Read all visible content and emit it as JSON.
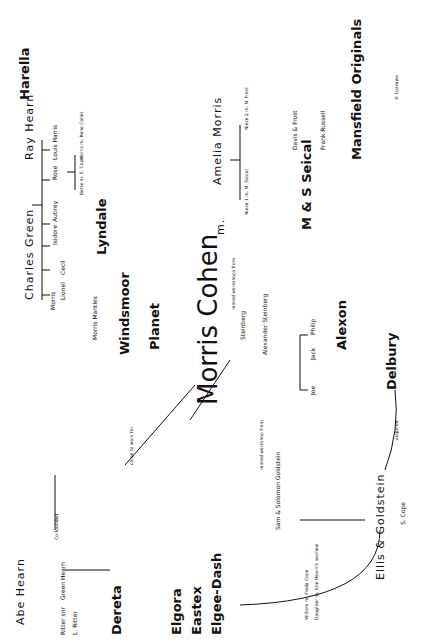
{
  "diagram": {
    "center": "Morris Cohen",
    "spouse_marker": "m.",
    "left_family": {
      "parents": [
        "Charles Green",
        "Ray Hearn"
      ],
      "children": [
        "Morris",
        "Lionel",
        "Cecil",
        "Isidore",
        "Aubrey",
        "Rose"
      ],
      "rose_spouse": "Louis Harris",
      "rose_children": [
        "Bette m. S. Cope",
        "Morris m. Rene Collet"
      ],
      "companies": [
        "Lyndale",
        "Windsmoor",
        "Planet",
        "Harella",
        "Morris Mantles"
      ],
      "labels": {
        "lozzawa": "LOZZAWA",
        "founded": "FOUNDED",
        "became": "BECAME"
      }
    },
    "right_family": {
      "spouse": "Amelia Morris",
      "nieces": [
        "Niece 1 m. M. Seical",
        "Niece 2 m. N. Frost"
      ],
      "companies": [
        "M & S Seical",
        "Davis & Frost",
        "Frank Russell",
        "Mansfield Originals"
      ],
      "labels": {
        "founded": "FOUNDED",
        "employed": "EMPLOYED"
      }
    },
    "steinberg": {
      "note": "rented workshops from",
      "names": [
        "Steinberg",
        "Alexander Steinberg",
        "Joe",
        "Jack",
        "Philip"
      ],
      "companies": [
        "Alexon",
        "Delbury"
      ],
      "label": "LOZZAWA"
    },
    "lower": {
      "founders": [
        "Abe Hearn",
        "Charles Green"
      ],
      "cofounded": "Co-founded",
      "green_hearn": "Green Hearn",
      "ritter": [
        "Ritter snr",
        "L. Ritter"
      ],
      "worked_for": "worked for",
      "companies": [
        "Dereta",
        "Elgora",
        "Eastex",
        "Elgee-Dash"
      ],
      "goldstein": "Sam & Solomon Goldstein",
      "goldstein_children": [
        "William m. Freda Cope",
        "Daughter m. Abe Hearn's nephew"
      ],
      "ellis": "Ellis & Goldstein",
      "ellis_employed": "S. Cope",
      "rented": "rented workshop from",
      "came_to_work": "came to work for",
      "acquired": "acquired",
      "euro_awa": "EURO-AWA"
    },
    "copyright": "© Lozzawa"
  }
}
